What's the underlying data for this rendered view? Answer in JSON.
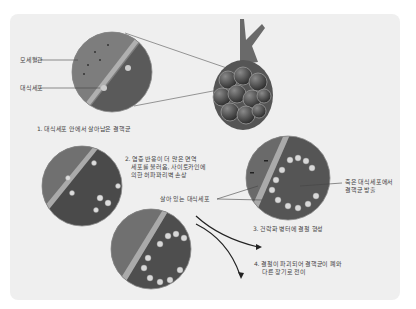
{
  "diagram": {
    "labels": {
      "capillary": "모세혈관",
      "macrophage": "대식세포",
      "step1": "1. 대식세포 안에서 살아남은 결핵균",
      "step2_line1": "2. 염증 반응이 더 많은 면역",
      "step2_line2": "세포를 불러옴, 사이토카인에",
      "step2_line3": "의한 허파꽈리벽 손상",
      "live_macrophage": "살아 있는 대식세포",
      "dead_macrophage_line1": "죽은 대식세포에서",
      "dead_macrophage_line2": "결핵균 방출",
      "step3": "3. 건락화 병터에 결절 형성",
      "step4_line1": "4. 결절이 파괴되어 결핵균이 폐와",
      "step4_line2": "다른 장기로 전이"
    },
    "colors": {
      "panel": "#efefef",
      "tissue_dark": "#4a4a4a",
      "vessel": "#8a8a8a",
      "text": "#444444"
    }
  }
}
